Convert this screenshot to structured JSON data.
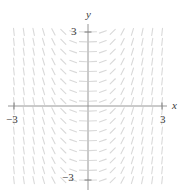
{
  "figure": {
    "kind": "slope-field",
    "background": "#ffffff"
  },
  "labels": {
    "x_axis": "x",
    "y_axis": "y",
    "x_min_tick": "−3",
    "x_max_tick": "3",
    "y_min_tick": "−3",
    "y_max_tick": "3"
  },
  "colors": {
    "axis": "#8a8a8a",
    "tick_mark": "#6e6e6e",
    "segment": "#d9d9d9",
    "label": "#3a3a3a"
  },
  "chart_data": {
    "type": "scatter",
    "title": "",
    "xlabel": "x",
    "ylabel": "y",
    "xlim": [
      -3.2,
      3.2
    ],
    "ylim": [
      -3.0,
      3.0
    ],
    "grid": false,
    "legend": null,
    "xticks": [
      -3,
      3
    ],
    "yticks": [
      -3,
      3
    ],
    "xticklabels": [
      "−3",
      "3"
    ],
    "yticklabels": [
      "−3",
      "3"
    ],
    "slope_rule": "dy/dx = f(x), odd in x, magnitude grows steeply with |x|",
    "origin_px": [
      88,
      106
    ],
    "pixels_per_unit": 24.7,
    "sample_grid": {
      "x_start": -3.0,
      "x_end": 3.0,
      "y_start": -3.0,
      "y_end": 3.0,
      "step": 0.4
    },
    "slope_samples": [
      {
        "x": -3.0,
        "slope": -9.0
      },
      {
        "x": -2.6,
        "slope": -6.76
      },
      {
        "x": -2.2,
        "slope": -4.84
      },
      {
        "x": -1.8,
        "slope": -3.24
      },
      {
        "x": -1.4,
        "slope": -1.96
      },
      {
        "x": -1.0,
        "slope": -1.0
      },
      {
        "x": -0.6,
        "slope": -0.36
      },
      {
        "x": -0.2,
        "slope": -0.04
      },
      {
        "x": 0.2,
        "slope": 0.04
      },
      {
        "x": 0.6,
        "slope": 0.36
      },
      {
        "x": 1.0,
        "slope": 1.0
      },
      {
        "x": 1.4,
        "slope": 1.96
      },
      {
        "x": 1.8,
        "slope": 3.24
      },
      {
        "x": 2.2,
        "slope": 4.84
      },
      {
        "x": 2.6,
        "slope": 6.76
      },
      {
        "x": 3.0,
        "slope": 9.0
      }
    ]
  }
}
